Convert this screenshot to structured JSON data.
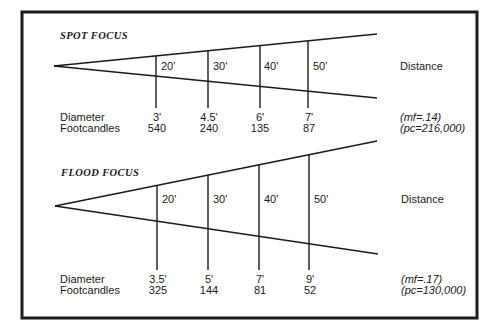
{
  "spot": {
    "title": "SPOT FOCUS",
    "distances": [
      "20'",
      "30'",
      "40'",
      "50'"
    ],
    "distance_label": "Distance",
    "row_labels": [
      "Diameter",
      "Footcandles"
    ],
    "diameters": [
      "3'",
      "4.5'",
      "6'",
      "7'"
    ],
    "footcandles": [
      "540",
      "240",
      "135",
      "87"
    ],
    "mf": "(mf=.14)",
    "pc": "(pc=216,000)"
  },
  "flood": {
    "title": "FLOOD FOCUS",
    "distances": [
      "20'",
      "30'",
      "40'",
      "50'"
    ],
    "distance_label": "Distance",
    "row_labels": [
      "Diameter",
      "Footcandles"
    ],
    "diameters": [
      "3.5'",
      "5'",
      "7'",
      "9'"
    ],
    "footcandles": [
      "325",
      "144",
      "81",
      "52"
    ],
    "mf": "(mf=.17)",
    "pc": "(pc=130,000)"
  },
  "colors": {
    "ink": "#1a1a1a",
    "background": "#ffffff"
  }
}
